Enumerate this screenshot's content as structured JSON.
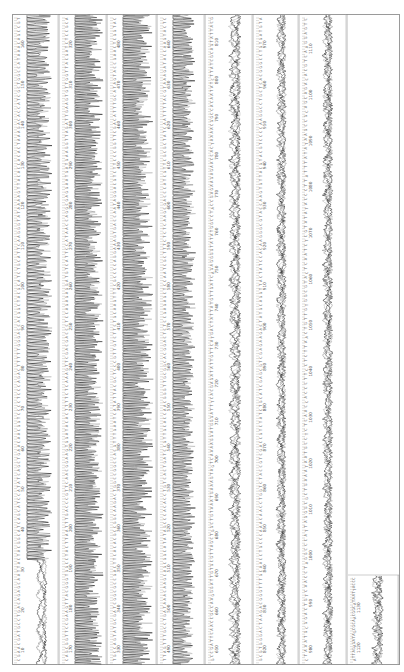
{
  "chart_data": {
    "type": "line",
    "title": "",
    "xlabel": "Base position",
    "ylabel": "Fluorescence intensity",
    "orientation": "rotated-90",
    "series": [
      {
        "name": "A",
        "color": "#3a3a3a"
      },
      {
        "name": "C",
        "color": "#1a1a1a"
      },
      {
        "name": "G",
        "color": "#8c8c8c"
      },
      {
        "name": "T",
        "color": "#b5b5b5"
      }
    ],
    "strips": [
      {
        "index": 1,
        "start": 10,
        "end": 160,
        "quality": "low-start",
        "labels": [
          10,
          20,
          30,
          40,
          50,
          60,
          70,
          80,
          90,
          100,
          110,
          120,
          130,
          140,
          150,
          160
        ]
      },
      {
        "index": 2,
        "start": 170,
        "end": 320,
        "quality": "high",
        "labels": [
          170,
          180,
          190,
          200,
          210,
          220,
          230,
          240,
          250,
          260,
          270,
          280,
          290,
          300,
          310,
          320
        ]
      },
      {
        "index": 3,
        "start": 330,
        "end": 480,
        "quality": "high",
        "labels": [
          330,
          340,
          350,
          360,
          370,
          380,
          390,
          400,
          410,
          420,
          430,
          440,
          450,
          460,
          470,
          480
        ]
      },
      {
        "index": 4,
        "start": 490,
        "end": 640,
        "quality": "medium",
        "labels": [
          490,
          500,
          510,
          520,
          530,
          540,
          550,
          560,
          570,
          580,
          590,
          600,
          610,
          620,
          630,
          640
        ]
      },
      {
        "index": 5,
        "start": 650,
        "end": 810,
        "quality": "declining",
        "labels": [
          650,
          660,
          670,
          680,
          690,
          700,
          710,
          720,
          730,
          740,
          750,
          760,
          770,
          780,
          790,
          800,
          810
        ]
      },
      {
        "index": 6,
        "start": 820,
        "end": 970,
        "quality": "low",
        "labels": [
          820,
          830,
          840,
          850,
          860,
          870,
          880,
          890,
          900,
          910,
          920,
          930,
          940,
          950,
          960,
          970
        ]
      },
      {
        "index": 7,
        "start": 980,
        "end": 1110,
        "quality": "very-low",
        "labels": [
          980,
          990,
          1000,
          1010,
          1020,
          1030,
          1040,
          1050,
          1060,
          1070,
          1080,
          1090,
          1100,
          1110
        ]
      },
      {
        "index": 8,
        "start": 1120,
        "end": 1130,
        "quality": "very-low",
        "labels": [
          1120,
          1130
        ]
      }
    ],
    "axis_range": [
      10,
      1130
    ],
    "grid": false,
    "legend": "none"
  }
}
